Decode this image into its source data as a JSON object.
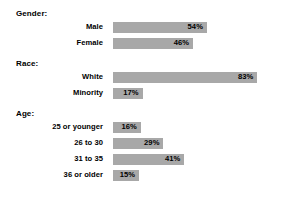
{
  "chart_data": {
    "type": "bar",
    "orientation": "horizontal",
    "title": "",
    "xlabel": "",
    "ylabel": "",
    "xlim": [
      0,
      100
    ],
    "grid": false,
    "legend": null,
    "value_suffix": "%",
    "bar_color": "#a8a8a8",
    "background_color": "#ffffff",
    "text_color": "#000000",
    "groups": [
      {
        "header": "Gender:",
        "items": [
          {
            "label": "Male",
            "value": 54,
            "value_label": "54%"
          },
          {
            "label": "Female",
            "value": 46,
            "value_label": "46%"
          }
        ]
      },
      {
        "header": "Race:",
        "items": [
          {
            "label": "White",
            "value": 83,
            "value_label": "83%"
          },
          {
            "label": "Minority",
            "value": 17,
            "value_label": "17%"
          }
        ]
      },
      {
        "header": "Age:",
        "items": [
          {
            "label": "25 or younger",
            "value": 16,
            "value_label": "16%"
          },
          {
            "label": "26 to 30",
            "value": 29,
            "value_label": "29%"
          },
          {
            "label": "31 to 35",
            "value": 41,
            "value_label": "41%"
          },
          {
            "label": "36 or older",
            "value": 15,
            "value_label": "15%"
          }
        ]
      }
    ],
    "categories": [
      "Male",
      "Female",
      "White",
      "Minority",
      "25 or younger",
      "26 to 30",
      "31 to 35",
      "36 or older"
    ],
    "values": [
      54,
      46,
      83,
      17,
      16,
      29,
      41,
      15
    ]
  }
}
